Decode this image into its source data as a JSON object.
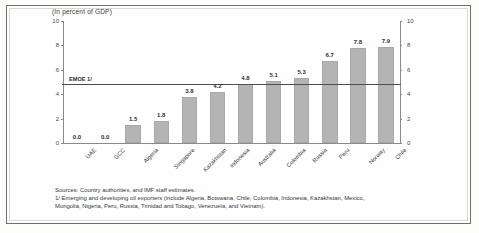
{
  "chart_data": {
    "type": "bar",
    "title": "(In percent of GDP)",
    "xlabel": "",
    "ylabel": "",
    "ylim": [
      0,
      10
    ],
    "yticks": [
      0,
      2,
      4,
      6,
      8,
      10
    ],
    "right_axis": true,
    "right_yticks": [
      0,
      2,
      4,
      6,
      8,
      10
    ],
    "grid": false,
    "legend": "none",
    "bar_color": "#b4b4b4",
    "categories": [
      "UAE",
      "GCC",
      "Algeria",
      "Singapore",
      "Kazakhstan",
      "Indonesia",
      "Australia",
      "Colombia",
      "Russia",
      "Peru",
      "Norway",
      "Chile"
    ],
    "values": [
      0.0,
      0.0,
      1.5,
      1.8,
      3.8,
      4.2,
      4.8,
      5.1,
      5.3,
      6.7,
      7.8,
      7.9
    ],
    "value_labels": [
      "0.0",
      "0.0",
      "1.5",
      "1.8",
      "3.8",
      "4.2",
      "4.8",
      "5.1",
      "5.3",
      "6.7",
      "7.8",
      "7.9"
    ],
    "annotations": [
      {
        "name": "emoe-reference-line",
        "label": "EMOE 1/",
        "value": 4.8,
        "type": "hline"
      }
    ]
  },
  "notes": {
    "line1": "Sources: Country authorities, and IMF staff estimates.",
    "line2": "1/ Emerging and developing oil exporters (include Algeria, Botswana, Chile, Colombia, Indonesia, Kazakhstan, Mexico,",
    "line3": "Mongolia, Nigeria, Peru, Russia, Trinidad and Tobago, Venezuela, and Vietnam)."
  }
}
